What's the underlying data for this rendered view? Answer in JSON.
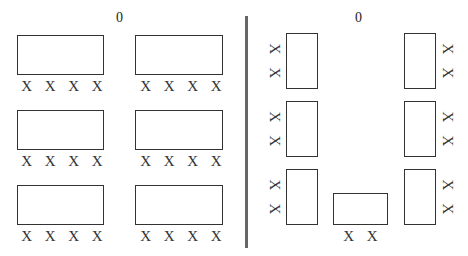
{
  "left_panel": {
    "label": "0",
    "tables": [
      {
        "id": "t1",
        "seats": [
          "X",
          "X",
          "X",
          "X"
        ]
      },
      {
        "id": "t2",
        "seats": [
          "X",
          "X",
          "X",
          "X"
        ]
      },
      {
        "id": "t3",
        "seats": [
          "X",
          "X",
          "X",
          "X"
        ]
      },
      {
        "id": "t4",
        "seats": [
          "X",
          "X",
          "X",
          "X"
        ]
      },
      {
        "id": "t5",
        "seats": [
          "X",
          "X",
          "X",
          "X"
        ]
      },
      {
        "id": "t6",
        "seats": [
          "X",
          "X",
          "X",
          "X"
        ]
      }
    ]
  },
  "right_panel": {
    "label": "0",
    "left_column": [
      {
        "seats": [
          "X",
          "X"
        ]
      },
      {
        "seats": [
          "X",
          "X"
        ]
      },
      {
        "seats": [
          "X",
          "X"
        ]
      }
    ],
    "right_column": [
      {
        "seats": [
          "X",
          "X"
        ]
      },
      {
        "seats": [
          "X",
          "X"
        ]
      },
      {
        "seats": [
          "X",
          "X"
        ]
      }
    ],
    "bottom_table": {
      "seats": [
        "X",
        "X"
      ]
    }
  },
  "colors": {
    "stroke": "#333333",
    "divider": "#666666",
    "background": "#ffffff"
  }
}
